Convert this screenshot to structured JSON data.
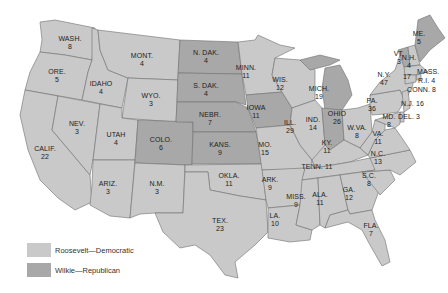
{
  "colors": {
    "democratic": "#c9c9c9",
    "republican": "#a8a8a8",
    "border": "#6e6e6e"
  },
  "legend": [
    {
      "label": "Roosevelt—Democratic",
      "party": "democratic"
    },
    {
      "label": "Wilkie—Republican",
      "party": "republican"
    }
  ],
  "states": [
    {
      "abbr": "WASH.",
      "votes": "8",
      "party": "democratic"
    },
    {
      "abbr": "ORE.",
      "votes": "5",
      "party": "democratic"
    },
    {
      "abbr": "CALIF.",
      "votes": "22",
      "party": "democratic"
    },
    {
      "abbr": "IDAHO",
      "votes": "4",
      "party": "democratic"
    },
    {
      "abbr": "NEV.",
      "votes": "3",
      "party": "democratic"
    },
    {
      "abbr": "MONT.",
      "votes": "4",
      "party": "democratic"
    },
    {
      "abbr": "WYO.",
      "votes": "3",
      "party": "democratic"
    },
    {
      "abbr": "UTAH",
      "votes": "4",
      "party": "democratic"
    },
    {
      "abbr": "ARIZ.",
      "votes": "3",
      "party": "democratic"
    },
    {
      "abbr": "COLO.",
      "votes": "6",
      "party": "republican"
    },
    {
      "abbr": "N.M.",
      "votes": "3",
      "party": "democratic"
    },
    {
      "abbr": "N. DAK.",
      "votes": "4",
      "party": "republican"
    },
    {
      "abbr": "S. DAK.",
      "votes": "4",
      "party": "republican"
    },
    {
      "abbr": "NEBR.",
      "votes": "7",
      "party": "republican"
    },
    {
      "abbr": "KANS.",
      "votes": "9",
      "party": "republican"
    },
    {
      "abbr": "OKLA.",
      "votes": "11",
      "party": "democratic"
    },
    {
      "abbr": "TEX.",
      "votes": "23",
      "party": "democratic"
    },
    {
      "abbr": "MINN.",
      "votes": "11",
      "party": "democratic"
    },
    {
      "abbr": "IOWA",
      "votes": "11",
      "party": "republican"
    },
    {
      "abbr": "MO.",
      "votes": "15",
      "party": "democratic"
    },
    {
      "abbr": "ARK.",
      "votes": "9",
      "party": "democratic"
    },
    {
      "abbr": "LA.",
      "votes": "10",
      "party": "democratic"
    },
    {
      "abbr": "WIS.",
      "votes": "12",
      "party": "democratic"
    },
    {
      "abbr": "ILL.",
      "votes": "29",
      "party": "democratic"
    },
    {
      "abbr": "MICH.",
      "votes": "19",
      "party": "republican"
    },
    {
      "abbr": "IND.",
      "votes": "14",
      "party": "republican"
    },
    {
      "abbr": "OHIO",
      "votes": "26",
      "party": "democratic"
    },
    {
      "abbr": "KY.",
      "votes": "11",
      "party": "democratic"
    },
    {
      "abbr": "TENN.",
      "votes": "11",
      "party": "democratic"
    },
    {
      "abbr": "MISS.",
      "votes": "9",
      "party": "democratic"
    },
    {
      "abbr": "ALA.",
      "votes": "11",
      "party": "democratic"
    },
    {
      "abbr": "GA.",
      "votes": "12",
      "party": "democratic"
    },
    {
      "abbr": "FLA.",
      "votes": "7",
      "party": "democratic"
    },
    {
      "abbr": "S.C.",
      "votes": "8",
      "party": "democratic"
    },
    {
      "abbr": "N.C.",
      "votes": "13",
      "party": "democratic"
    },
    {
      "abbr": "VA.",
      "votes": "11",
      "party": "democratic"
    },
    {
      "abbr": "W.VA.",
      "votes": "8",
      "party": "democratic"
    },
    {
      "abbr": "PA.",
      "votes": "36",
      "party": "democratic"
    },
    {
      "abbr": "N.Y.",
      "votes": "47",
      "party": "democratic"
    },
    {
      "abbr": "VT.",
      "votes": "3",
      "party": "republican"
    },
    {
      "abbr": "N.H.",
      "votes": "4",
      "party": "democratic"
    },
    {
      "abbr": "ME.",
      "votes": "5",
      "party": "republican"
    },
    {
      "abbr": "MASS.",
      "votes": "17",
      "party": "democratic"
    },
    {
      "abbr": "R.I.",
      "votes": "4",
      "party": "democratic"
    },
    {
      "abbr": "CONN.",
      "votes": "8",
      "party": "democratic"
    },
    {
      "abbr": "N.J.",
      "votes": "16",
      "party": "democratic"
    },
    {
      "abbr": "DEL.",
      "votes": "3",
      "party": "democratic"
    },
    {
      "abbr": "MD.",
      "votes": "8",
      "party": "democratic"
    }
  ],
  "labels": {
    "wash": "WASH.",
    "wash_v": "8",
    "ore": "ORE.",
    "ore_v": "5",
    "calif": "CALIF.",
    "calif_v": "22",
    "idaho": "IDAHO",
    "idaho_v": "4",
    "nev": "NEV.",
    "nev_v": "3",
    "mont": "MONT.",
    "mont_v": "4",
    "wyo": "WYO.",
    "wyo_v": "3",
    "utah": "UTAH",
    "utah_v": "4",
    "ariz": "ARIZ.",
    "ariz_v": "3",
    "colo": "COLO.",
    "colo_v": "6",
    "nm": "N.M.",
    "nm_v": "3",
    "ndak": "N. DAK.",
    "ndak_v": "4",
    "sdak": "S. DAK.",
    "sdak_v": "4",
    "nebr": "NEBR.",
    "nebr_v": "7",
    "kans": "KANS.",
    "kans_v": "9",
    "okla": "OKLA.",
    "okla_v": "11",
    "tex": "TEX.",
    "tex_v": "23",
    "minn": "MINN.",
    "minn_v": "11",
    "iowa": "IOWA",
    "iowa_v": "11",
    "mo": "MO.",
    "mo_v": "15",
    "ark": "ARK.",
    "ark_v": "9",
    "la": "LA.",
    "la_v": "10",
    "wis": "WIS.",
    "wis_v": "12",
    "ill": "ILL.",
    "ill_v": "29",
    "mich": "MICH.",
    "mich_v": "19",
    "ind": "IND.",
    "ind_v": "14",
    "ohio": "OHIO",
    "ohio_v": "26",
    "ky": "KY.",
    "ky_v": "11",
    "tenn": "TENN. 11",
    "miss": "MISS.",
    "miss_v": "9",
    "ala": "ALA.",
    "ala_v": "11",
    "ga": "GA.",
    "ga_v": "12",
    "fla": "FLA.",
    "fla_v": "7",
    "sc": "S.C.",
    "sc_v": "8",
    "nc": "N.C.",
    "nc_v": "13",
    "va": "VA.",
    "va_v": "11",
    "wva": "W.VA.",
    "wva_v": "8",
    "pa": "PA.",
    "pa_v": "36",
    "ny": "N.Y.",
    "ny_v": "47",
    "vt": "VT.",
    "vt_v": "3",
    "nh": "N.H.",
    "nh_v": "4",
    "me": "ME.",
    "me_v": "5",
    "mass": "MASS.",
    "mass_v": "17",
    "ri": "R.I. 4",
    "conn": "CONN. 8",
    "nj": "N.J. 16",
    "del": "DEL. 3",
    "md": "MD.",
    "md_v": "8"
  }
}
